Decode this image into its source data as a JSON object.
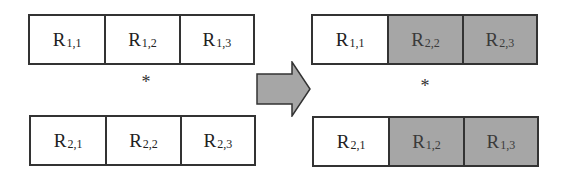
{
  "left": {
    "top_row": [
      {
        "base": "R",
        "sub": "1,1",
        "shaded": false
      },
      {
        "base": "R",
        "sub": "1,2",
        "shaded": false
      },
      {
        "base": "R",
        "sub": "1,3",
        "shaded": false
      }
    ],
    "operator": "*",
    "bottom_row": [
      {
        "base": "R",
        "sub": "2,1",
        "shaded": false
      },
      {
        "base": "R",
        "sub": "2,2",
        "shaded": false
      },
      {
        "base": "R",
        "sub": "2,3",
        "shaded": false
      }
    ]
  },
  "arrow": {
    "icon": "right-arrow-icon",
    "fill": "#a6a6a6"
  },
  "right": {
    "top_row": [
      {
        "base": "R",
        "sub": "1,1",
        "shaded": false
      },
      {
        "base": "R",
        "sub": "2,2",
        "shaded": true
      },
      {
        "base": "R",
        "sub": "2,3",
        "shaded": true
      }
    ],
    "operator": "*",
    "bottom_row": [
      {
        "base": "R",
        "sub": "2,1",
        "shaded": false
      },
      {
        "base": "R",
        "sub": "1,2",
        "shaded": true
      },
      {
        "base": "R",
        "sub": "1,3",
        "shaded": true
      }
    ]
  },
  "colors": {
    "shaded": "#a6a6a6",
    "border": "#333333",
    "background": "#ffffff"
  }
}
